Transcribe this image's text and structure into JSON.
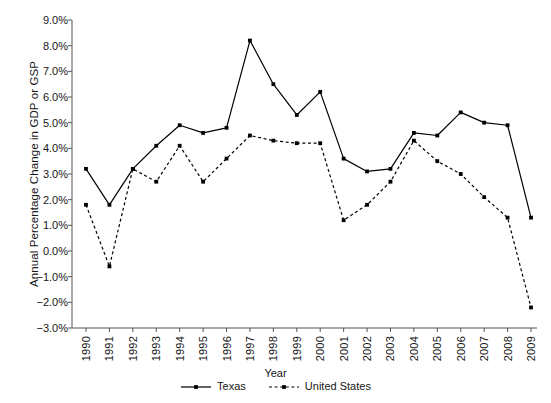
{
  "chart_data": {
    "type": "line",
    "title": "",
    "xlabel": "Year",
    "ylabel": "Annual Percentage Change in GDP or GSP",
    "categories": [
      "1990",
      "1991",
      "1992",
      "1993",
      "1994",
      "1995",
      "1996",
      "1997",
      "1998",
      "1999",
      "2000",
      "2001",
      "2002",
      "2003",
      "2004",
      "2005",
      "2006",
      "2007",
      "2008",
      "2009"
    ],
    "series": [
      {
        "name": "Texas",
        "style": "solid",
        "marker": "square",
        "color": "#000000",
        "values": [
          3.2,
          1.8,
          3.2,
          4.1,
          4.9,
          4.6,
          4.8,
          8.2,
          6.5,
          5.3,
          6.2,
          3.6,
          3.1,
          3.2,
          4.6,
          4.5,
          5.4,
          5.0,
          4.9,
          1.3
        ]
      },
      {
        "name": "United States",
        "style": "dashed",
        "marker": "square",
        "color": "#000000",
        "values": [
          1.8,
          -0.6,
          3.2,
          2.7,
          4.1,
          2.7,
          3.6,
          4.5,
          4.3,
          4.2,
          4.2,
          1.2,
          1.8,
          2.7,
          4.3,
          3.5,
          3.0,
          2.1,
          1.3,
          -2.2
        ]
      }
    ],
    "ylim": [
      -3.0,
      9.0
    ],
    "ytick_values": [
      9.0,
      8.0,
      7.0,
      6.0,
      5.0,
      4.0,
      3.0,
      2.0,
      1.0,
      0.0,
      -1.0,
      -2.0,
      -3.0
    ],
    "ytick_labels": [
      "9.0%",
      "8.0%",
      "7.0%",
      "6.0%",
      "5.0%",
      "4.0%",
      "3.0%",
      "2.0%",
      "1.0%",
      "0.0%",
      "−1.0%",
      "−2.0%",
      "−3.0%"
    ],
    "grid": false,
    "legend_position": "bottom"
  },
  "legend": {
    "items": [
      {
        "label": "Texas"
      },
      {
        "label": "United States"
      }
    ]
  }
}
